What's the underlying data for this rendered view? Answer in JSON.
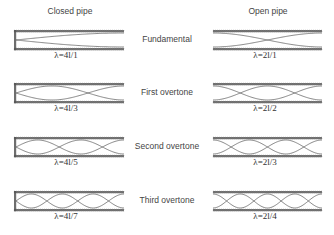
{
  "headers": {
    "closed": "Closed pipe",
    "open": "Open pipe"
  },
  "rows": [
    {
      "mode": "Fundamental",
      "closed_lambda": "λ=4l/1",
      "open_lambda": "λ=2l/1",
      "closed_quarter_waves": 1,
      "open_half_waves": 1
    },
    {
      "mode": "First overtone",
      "closed_lambda": "λ=4l/3",
      "open_lambda": "λ=2l/2",
      "closed_quarter_waves": 3,
      "open_half_waves": 2
    },
    {
      "mode": "Second overtone",
      "closed_lambda": "λ=4l/5",
      "open_lambda": "λ=2l/3",
      "closed_quarter_waves": 5,
      "open_half_waves": 3
    },
    {
      "mode": "Third overtone",
      "closed_lambda": "λ=4l/7",
      "open_lambda": "λ=2l/4",
      "closed_quarter_waves": 7,
      "open_half_waves": 4
    }
  ],
  "colors": {
    "pipe_wall": "#555555",
    "wave": "#666666",
    "text": "#444444"
  }
}
